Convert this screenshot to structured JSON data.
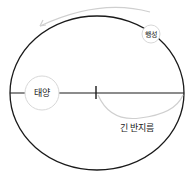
{
  "diagram": {
    "title": "",
    "labels": {
      "sun": "태양",
      "planet": "행성",
      "semi_major_axis": "긴 반지름"
    },
    "colors": {
      "orbit": "#1a1a1a",
      "axis": "#1a1a1a",
      "guide": "#cfcfcf",
      "body_outline": "#d8d8d8",
      "text": "#222222"
    }
  }
}
